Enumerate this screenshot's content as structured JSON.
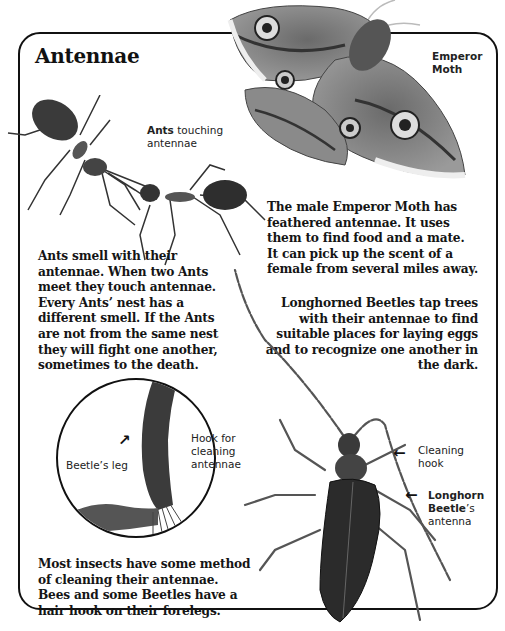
{
  "page": {
    "title": "Antennae"
  },
  "labels": {
    "emperor_moth": [
      "Emperor",
      "Moth"
    ],
    "ants_touching": {
      "bold": "Ants",
      "rest": " touching",
      "line2": "antennae"
    },
    "beetles_leg": "Beetle’s leg",
    "hook_for_cleaning": [
      "Hook for",
      "cleaning",
      "antennae"
    ],
    "cleaning_hook": [
      "Cleaning",
      "hook"
    ],
    "longhorn_beetle": {
      "line1": "Longhorn",
      "line2_bold": "Beetle",
      "line2_rest": "’s",
      "line3": "antenna"
    }
  },
  "paragraphs": {
    "moth": "The male Emperor Moth has feathered antennae. It uses them to find food and a mate. It can pick up the scent of a female from several miles away.",
    "ants": "Ants smell with their antennae. When two Ants meet they touch antennae. Every Ants’ nest has a different smell. If the Ants are not from the same nest they will fight one another, sometimes to the death.",
    "longhorn": "Longhorned Beetles tap trees with their antennae to find suitable places for laying eggs and to recognize one another in the dark.",
    "cleaning": "Most insects have some method of cleaning their antennae. Bees and some Beetles have a hair hook on their forelegs."
  },
  "paragraph_lines": {
    "moth": [
      "The male Emperor Moth has",
      "feathered antennae. It uses",
      "them to find food and a mate.",
      "It can pick up the scent of a",
      "female from several miles away."
    ],
    "ants": [
      "Ants smell with their",
      "antennae. When two Ants",
      "meet they touch antennae.",
      "Every Ants’ nest has a",
      "different smell. If the Ants",
      "are not from the same nest",
      "they will fight one another,",
      "sometimes to the death."
    ],
    "longhorn": [
      "Longhorned Beetles tap trees",
      "with their antennae to find",
      "suitable places for laying eggs",
      "and to recognize one another in",
      "the dark."
    ],
    "cleaning": [
      "Most insects have some method",
      "of cleaning their antennae.",
      "Bees and some Beetles have a",
      "hair hook on their forelegs."
    ]
  },
  "arrows": {
    "glyph_left": "←",
    "glyph_curve": "↗"
  }
}
